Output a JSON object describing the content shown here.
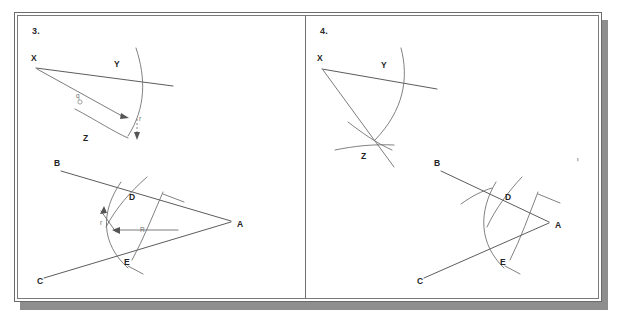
{
  "document": {
    "kind": "scanned-worksheet-page",
    "background_color": "#ffffff",
    "frame_shadow_color": "#8e8e8e",
    "ink_color": "#4a4a4a",
    "arc_color": "#6a6a6a"
  },
  "panels": [
    {
      "number_label": "3.",
      "name": "panel-3",
      "figures": [
        {
          "name": "angle-copy-construction",
          "points": [
            {
              "label": "X",
              "role": "vertex"
            },
            {
              "label": "Y",
              "role": "arc-intersection-upper"
            },
            {
              "label": "Z",
              "role": "arc-intersection-lower"
            }
          ],
          "measure_labels": [
            {
              "label": "q",
              "role": "radius-arc-marker"
            },
            {
              "label": "r",
              "role": "chord-span-marker"
            }
          ]
        },
        {
          "name": "angle-bisector-construction",
          "points": [
            {
              "label": "B",
              "role": "ray-end-upper"
            },
            {
              "label": "A",
              "role": "vertex"
            },
            {
              "label": "C",
              "role": "ray-end-lower"
            },
            {
              "label": "D",
              "role": "arc-intersection-upper-ray"
            },
            {
              "label": "E",
              "role": "arc-intersection-lower-ray"
            }
          ],
          "measure_labels": [
            {
              "label": "r",
              "role": "small-arc-radius"
            },
            {
              "label": "R",
              "role": "large-arc-radius"
            }
          ]
        }
      ]
    },
    {
      "number_label": "4.",
      "name": "panel-4",
      "figures": [
        {
          "name": "angle-copy-construction",
          "points": [
            {
              "label": "X",
              "role": "vertex"
            },
            {
              "label": "Y",
              "role": "arc-intersection-upper"
            },
            {
              "label": "Z",
              "role": "arc-intersection-lower"
            }
          ],
          "measure_labels": []
        },
        {
          "name": "angle-bisector-construction",
          "points": [
            {
              "label": "B",
              "role": "ray-end-upper"
            },
            {
              "label": "A",
              "role": "vertex"
            },
            {
              "label": "C",
              "role": "ray-end-lower"
            },
            {
              "label": "D",
              "role": "arc-intersection-upper-ray"
            },
            {
              "label": "E",
              "role": "arc-intersection-lower-ray"
            }
          ],
          "measure_labels": []
        }
      ]
    }
  ]
}
